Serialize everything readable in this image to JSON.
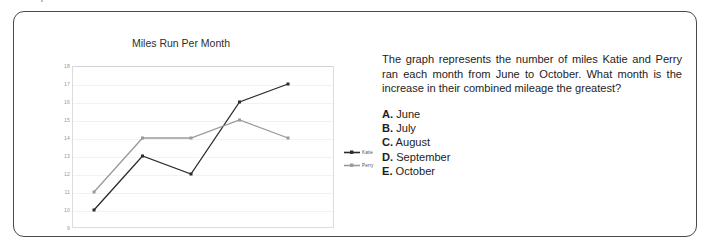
{
  "top_clipped_line": "the ... question",
  "chart_data": {
    "type": "line",
    "title": "Miles Run Per Month",
    "xlabel": "",
    "ylabel": "",
    "categories": [
      "June",
      "July",
      "August",
      "September",
      "October"
    ],
    "ylim": [
      9,
      18
    ],
    "yticks": [
      18,
      17,
      16,
      15,
      14,
      13,
      12,
      11,
      10,
      9
    ],
    "grid": true,
    "legend_position": "right",
    "series": [
      {
        "name": "Katie",
        "values": [
          10,
          13,
          12,
          16,
          17
        ],
        "color": "#2b2b2b"
      },
      {
        "name": "Perry",
        "values": [
          11,
          14,
          14,
          15,
          14
        ],
        "color": "#9a9a9a"
      }
    ]
  },
  "question": {
    "text": "The graph represents the number of miles Katie and Perry ran each month from June to October. What month is the increase in their combined mileage the greatest?",
    "options": [
      {
        "letter": "A.",
        "label": "June"
      },
      {
        "letter": "B.",
        "label": "July"
      },
      {
        "letter": "C.",
        "label": "August"
      },
      {
        "letter": "D.",
        "label": "September"
      },
      {
        "letter": "E.",
        "label": "October"
      }
    ]
  }
}
